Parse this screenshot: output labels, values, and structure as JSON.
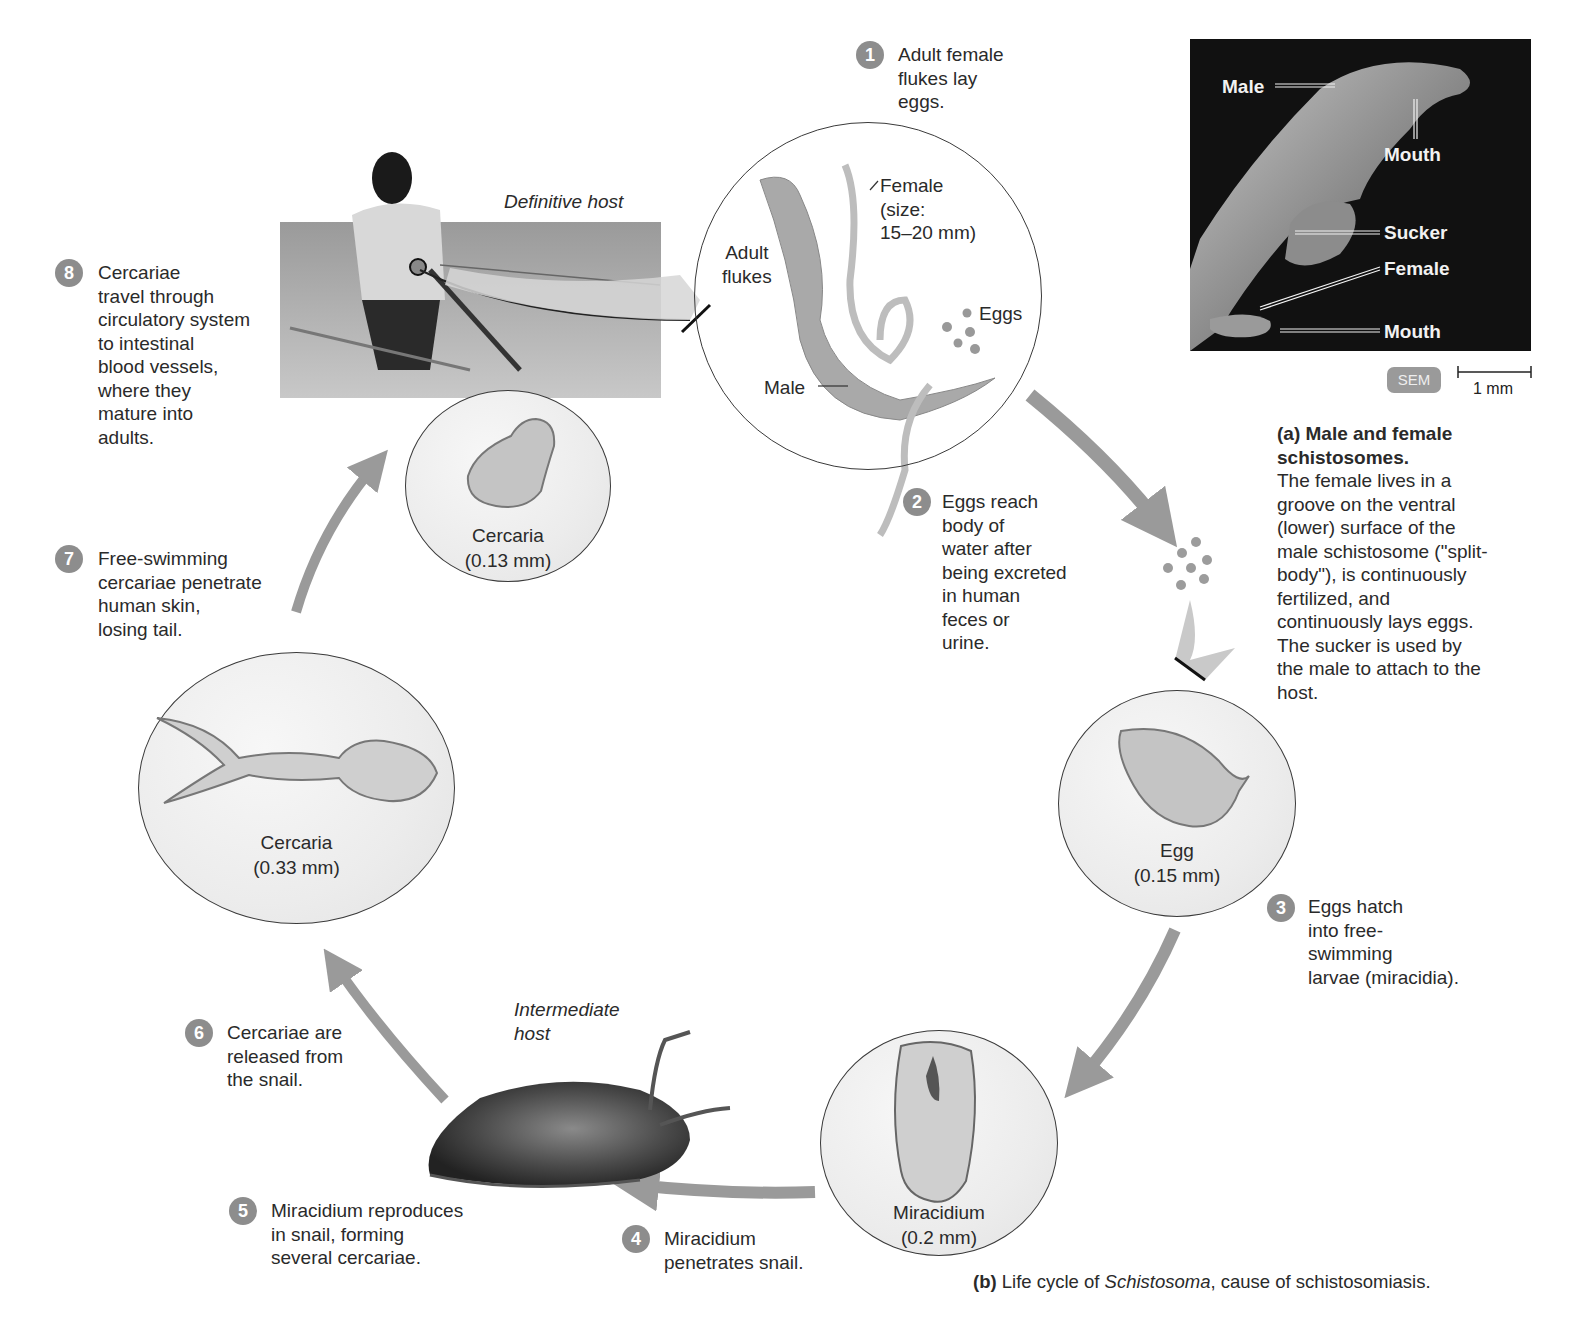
{
  "figure": {
    "title_b_prefix": "(b)",
    "title_b_text_1": " Life cycle of ",
    "title_b_italic": "Schistosoma",
    "title_b_text_2": ", cause of schistosomiasis."
  },
  "panel_a": {
    "sem_labels": {
      "male": "Male",
      "mouth_male": "Mouth",
      "sucker": "Sucker",
      "female": "Female",
      "mouth_female": "Mouth"
    },
    "sem_badge": "SEM",
    "scale_bar": "1 mm",
    "caption_title": "(a) Male and female schistosomes.",
    "caption_body": "The female lives in a groove on the ventral (lower) surface of the male schistosome (\"split-body\"), is continuously fertilized, and continuously lays eggs. The sucker is used by the male to attach to the host."
  },
  "hosts": {
    "definitive": "Definitive host",
    "intermediate": "Intermediate host"
  },
  "steps": [
    {
      "num": "1",
      "text": "Adult female\nflukes lay\neggs."
    },
    {
      "num": "2",
      "text": "Eggs reach\nbody of\nwater after\nbeing excreted\nin human\nfeces or\nurine."
    },
    {
      "num": "3",
      "text": "Eggs hatch\ninto free-\nswimming\nlarvae (miracidia)."
    },
    {
      "num": "4",
      "text": "Miracidium\npenetrates snail."
    },
    {
      "num": "5",
      "text": "Miracidium reproduces\nin snail, forming\nseveral cercariae."
    },
    {
      "num": "6",
      "text": "Cercariae are\nreleased from\nthe snail."
    },
    {
      "num": "7",
      "text": "Free-swimming\ncercariae penetrate\nhuman skin,\nlosing tail."
    },
    {
      "num": "8",
      "text": "Cercariae\ntravel through\ncirculatory system\nto intestinal\nblood vessels,\nwhere they\nmature into\nadults."
    }
  ],
  "adult_flukes_circle": {
    "label": "Adult\nflukes",
    "female_label": "Female\n(size:\n15–20 mm)",
    "eggs_label": "Eggs",
    "male_label": "Male"
  },
  "stage_circles": {
    "egg": {
      "name": "Egg",
      "size": "(0.15 mm)"
    },
    "miracidium": {
      "name": "Miracidium",
      "size": "(0.2 mm)"
    },
    "cercaria_large": {
      "name": "Cercaria",
      "size": "(0.33 mm)"
    },
    "cercaria_small": {
      "name": "Cercaria",
      "size": "(0.13 mm)"
    }
  },
  "colors": {
    "arrow": "#9a9a9a",
    "step_badge": "#8d8d8d",
    "sem_background": "#111111",
    "organism_fill": "#b8b8b8"
  }
}
